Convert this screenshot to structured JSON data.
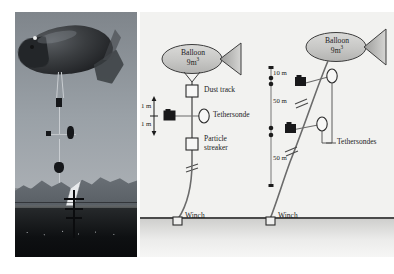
{
  "figure": {
    "type": "scientific-diagram",
    "panels": [
      "photograph",
      "schematic"
    ]
  },
  "photo": {
    "alt_name": "tethered-blimp-photograph",
    "scene": "tethered balloon aloft with instrument payload over mountain horizon"
  },
  "diagram": {
    "left_setup": {
      "balloon": {
        "name": "Balloon",
        "volume": "9m",
        "volume_exponent": "3"
      },
      "scale_segments": [
        {
          "label": "1 m"
        },
        {
          "label": "1 m"
        }
      ],
      "instruments": [
        {
          "label": "Dust track",
          "symbol": "open-square"
        },
        {
          "label": "Tethersonde",
          "symbol": "open-ellipse"
        },
        {
          "label": "Particle\nstreaker",
          "symbol": "open-square"
        }
      ],
      "instrument_labels": {
        "dust_track": "Dust track",
        "tethersonde": "Tethersonde",
        "particle_streaker_line1": "Particle",
        "particle_streaker_line2": "streaker"
      },
      "winch": "Winch"
    },
    "altitude_axis": {
      "ticks": [
        "10 m",
        "50 m",
        "50 m"
      ]
    },
    "right_setup": {
      "balloon": {
        "name": "Balloon",
        "volume": "9m",
        "volume_exponent": "3"
      },
      "tethersondes_label": "Tethersondes",
      "winch": "Winch"
    }
  },
  "colors": {
    "panel_background": "#f2f2f0",
    "ink": "#1c1c1c",
    "line": "#4a4a4a",
    "balloon_fill": "#c9c9c7",
    "instrument_dark": "#1a1a1a",
    "ground_top": "#cfcfcd"
  }
}
